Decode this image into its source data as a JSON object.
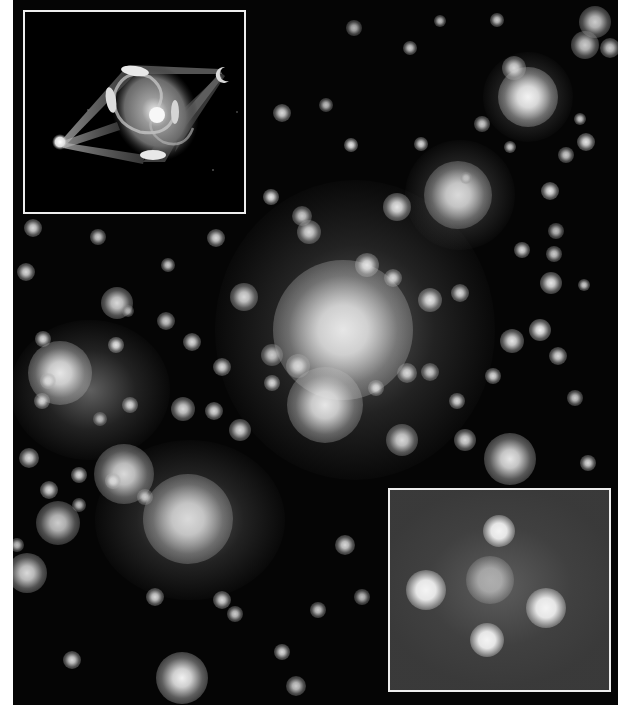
{
  "image": {
    "description": "Grayscale deep-field photograph of a galaxy cluster acting as a gravitational lens, with two bordered inset panels",
    "background_color": "#050505",
    "page_background": "#ffffff",
    "border_color": "#eeeeee"
  },
  "insets": {
    "top_left": {
      "label": "Gravitational lensing illustration",
      "content": "Spiral galaxy with light paths bent from a distant source to an observer"
    },
    "bottom_right": {
      "label": "Einstein cross close-up",
      "content": "Four lensed images surrounding a central galaxy"
    }
  },
  "galaxies": [
    {
      "x": 528,
      "y": 97,
      "r": 30,
      "b": 0.95
    },
    {
      "x": 458,
      "y": 195,
      "r": 34,
      "b": 0.85
    },
    {
      "x": 397,
      "y": 207,
      "r": 14,
      "b": 0.9
    },
    {
      "x": 343,
      "y": 330,
      "r": 70,
      "b": 0.9
    },
    {
      "x": 325,
      "y": 405,
      "r": 38,
      "b": 0.9
    },
    {
      "x": 60,
      "y": 373,
      "r": 32,
      "b": 0.9
    },
    {
      "x": 188,
      "y": 519,
      "r": 45,
      "b": 0.85
    },
    {
      "x": 124,
      "y": 474,
      "r": 30,
      "b": 0.85
    },
    {
      "x": 117,
      "y": 303,
      "r": 16,
      "b": 0.85
    },
    {
      "x": 510,
      "y": 459,
      "r": 26,
      "b": 0.9
    },
    {
      "x": 182,
      "y": 678,
      "r": 26,
      "b": 0.95
    },
    {
      "x": 58,
      "y": 523,
      "r": 22,
      "b": 0.8
    },
    {
      "x": 27,
      "y": 573,
      "r": 20,
      "b": 0.85
    },
    {
      "x": 402,
      "y": 440,
      "r": 16,
      "b": 0.85
    },
    {
      "x": 244,
      "y": 297,
      "r": 14,
      "b": 0.85
    },
    {
      "x": 540,
      "y": 330,
      "r": 11,
      "b": 0.95
    },
    {
      "x": 512,
      "y": 341,
      "r": 12,
      "b": 0.9
    },
    {
      "x": 551,
      "y": 283,
      "r": 11,
      "b": 0.9
    },
    {
      "x": 558,
      "y": 356,
      "r": 9,
      "b": 0.85
    },
    {
      "x": 595,
      "y": 22,
      "r": 16,
      "b": 0.8
    },
    {
      "x": 585,
      "y": 45,
      "r": 14,
      "b": 0.8
    },
    {
      "x": 514,
      "y": 68,
      "r": 12,
      "b": 0.85
    },
    {
      "x": 610,
      "y": 48,
      "r": 10,
      "b": 0.8
    },
    {
      "x": 550,
      "y": 191,
      "r": 9,
      "b": 0.9
    },
    {
      "x": 586,
      "y": 142,
      "r": 9,
      "b": 0.9
    },
    {
      "x": 566,
      "y": 155,
      "r": 8,
      "b": 0.8
    },
    {
      "x": 482,
      "y": 124,
      "r": 8,
      "b": 0.8
    },
    {
      "x": 421,
      "y": 144,
      "r": 7,
      "b": 0.85
    },
    {
      "x": 351,
      "y": 145,
      "r": 7,
      "b": 0.9
    },
    {
      "x": 410,
      "y": 48,
      "r": 7,
      "b": 0.8
    },
    {
      "x": 354,
      "y": 28,
      "r": 8,
      "b": 0.7
    },
    {
      "x": 326,
      "y": 105,
      "r": 7,
      "b": 0.75
    },
    {
      "x": 282,
      "y": 113,
      "r": 9,
      "b": 0.85
    },
    {
      "x": 271,
      "y": 197,
      "r": 8,
      "b": 0.9
    },
    {
      "x": 302,
      "y": 216,
      "r": 10,
      "b": 0.8
    },
    {
      "x": 309,
      "y": 232,
      "r": 12,
      "b": 0.85
    },
    {
      "x": 367,
      "y": 265,
      "r": 12,
      "b": 0.9
    },
    {
      "x": 393,
      "y": 278,
      "r": 9,
      "b": 0.85
    },
    {
      "x": 430,
      "y": 300,
      "r": 12,
      "b": 0.9
    },
    {
      "x": 460,
      "y": 293,
      "r": 9,
      "b": 0.85
    },
    {
      "x": 430,
      "y": 372,
      "r": 9,
      "b": 0.8
    },
    {
      "x": 407,
      "y": 373,
      "r": 10,
      "b": 0.85
    },
    {
      "x": 376,
      "y": 388,
      "r": 8,
      "b": 0.85
    },
    {
      "x": 298,
      "y": 366,
      "r": 12,
      "b": 0.85
    },
    {
      "x": 272,
      "y": 355,
      "r": 11,
      "b": 0.8
    },
    {
      "x": 222,
      "y": 367,
      "r": 9,
      "b": 0.85
    },
    {
      "x": 272,
      "y": 383,
      "r": 8,
      "b": 0.85
    },
    {
      "x": 192,
      "y": 342,
      "r": 9,
      "b": 0.85
    },
    {
      "x": 166,
      "y": 321,
      "r": 9,
      "b": 0.8
    },
    {
      "x": 216,
      "y": 238,
      "r": 9,
      "b": 0.85
    },
    {
      "x": 168,
      "y": 265,
      "r": 7,
      "b": 0.8
    },
    {
      "x": 26,
      "y": 272,
      "r": 9,
      "b": 0.85
    },
    {
      "x": 33,
      "y": 228,
      "r": 9,
      "b": 0.85
    },
    {
      "x": 43,
      "y": 339,
      "r": 8,
      "b": 0.85
    },
    {
      "x": 48,
      "y": 381,
      "r": 8,
      "b": 0.85
    },
    {
      "x": 42,
      "y": 401,
      "r": 8,
      "b": 0.85
    },
    {
      "x": 116,
      "y": 345,
      "r": 8,
      "b": 0.9
    },
    {
      "x": 183,
      "y": 409,
      "r": 12,
      "b": 0.85
    },
    {
      "x": 240,
      "y": 430,
      "r": 11,
      "b": 0.85
    },
    {
      "x": 214,
      "y": 411,
      "r": 9,
      "b": 0.85
    },
    {
      "x": 130,
      "y": 405,
      "r": 8,
      "b": 0.85
    },
    {
      "x": 29,
      "y": 458,
      "r": 10,
      "b": 0.85
    },
    {
      "x": 49,
      "y": 490,
      "r": 9,
      "b": 0.85
    },
    {
      "x": 79,
      "y": 475,
      "r": 8,
      "b": 0.85
    },
    {
      "x": 113,
      "y": 481,
      "r": 8,
      "b": 0.85
    },
    {
      "x": 145,
      "y": 497,
      "r": 8,
      "b": 0.8
    },
    {
      "x": 79,
      "y": 505,
      "r": 7,
      "b": 0.75
    },
    {
      "x": 155,
      "y": 597,
      "r": 9,
      "b": 0.85
    },
    {
      "x": 222,
      "y": 600,
      "r": 9,
      "b": 0.85
    },
    {
      "x": 235,
      "y": 614,
      "r": 8,
      "b": 0.8
    },
    {
      "x": 72,
      "y": 660,
      "r": 9,
      "b": 0.85
    },
    {
      "x": 282,
      "y": 652,
      "r": 8,
      "b": 0.85
    },
    {
      "x": 296,
      "y": 686,
      "r": 10,
      "b": 0.8
    },
    {
      "x": 345,
      "y": 545,
      "r": 10,
      "b": 0.85
    },
    {
      "x": 318,
      "y": 610,
      "r": 8,
      "b": 0.8
    },
    {
      "x": 362,
      "y": 597,
      "r": 8,
      "b": 0.75
    },
    {
      "x": 465,
      "y": 440,
      "r": 11,
      "b": 0.85
    },
    {
      "x": 457,
      "y": 401,
      "r": 8,
      "b": 0.85
    },
    {
      "x": 493,
      "y": 376,
      "r": 8,
      "b": 0.85
    },
    {
      "x": 588,
      "y": 463,
      "r": 8,
      "b": 0.85
    },
    {
      "x": 522,
      "y": 250,
      "r": 8,
      "b": 0.85
    },
    {
      "x": 554,
      "y": 254,
      "r": 8,
      "b": 0.8
    },
    {
      "x": 556,
      "y": 231,
      "r": 8,
      "b": 0.75
    },
    {
      "x": 575,
      "y": 398,
      "r": 8,
      "b": 0.8
    },
    {
      "x": 584,
      "y": 285,
      "r": 6,
      "b": 0.8
    },
    {
      "x": 98,
      "y": 237,
      "r": 8,
      "b": 0.8
    },
    {
      "x": 128,
      "y": 311,
      "r": 6,
      "b": 0.7
    },
    {
      "x": 100,
      "y": 419,
      "r": 7,
      "b": 0.75
    },
    {
      "x": 17,
      "y": 545,
      "r": 7,
      "b": 0.75
    },
    {
      "x": 440,
      "y": 21,
      "r": 6,
      "b": 0.75
    },
    {
      "x": 497,
      "y": 20,
      "r": 7,
      "b": 0.8
    },
    {
      "x": 580,
      "y": 119,
      "r": 6,
      "b": 0.8
    },
    {
      "x": 510,
      "y": 147,
      "r": 6,
      "b": 0.8
    },
    {
      "x": 466,
      "y": 178,
      "r": 6,
      "b": 0.75
    }
  ],
  "haze_regions": [
    {
      "x": 355,
      "y": 330,
      "w": 280,
      "h": 300
    },
    {
      "x": 190,
      "y": 520,
      "w": 190,
      "h": 160
    },
    {
      "x": 90,
      "y": 390,
      "w": 160,
      "h": 140
    },
    {
      "x": 528,
      "y": 97,
      "w": 90,
      "h": 90
    },
    {
      "x": 460,
      "y": 195,
      "w": 110,
      "h": 110
    }
  ],
  "einstein_cross": {
    "images": [
      {
        "x": 109,
        "y": 41,
        "r": 16
      },
      {
        "x": 36,
        "y": 100,
        "r": 20
      },
      {
        "x": 156,
        "y": 118,
        "r": 20
      },
      {
        "x": 97,
        "y": 150,
        "r": 17
      }
    ],
    "center": {
      "x": 100,
      "y": 90,
      "r": 24
    }
  }
}
